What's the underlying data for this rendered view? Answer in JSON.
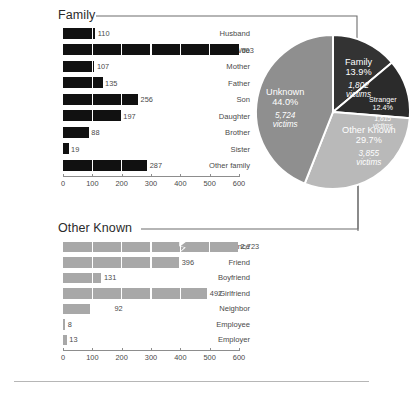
{
  "sections": {
    "family": {
      "title": "Family"
    },
    "other": {
      "title": "Other Known"
    }
  },
  "colors": {
    "family_bar": "#111111",
    "other_bar": "#a8a8a8",
    "pie_family": "#333333",
    "pie_stranger": "#2b2b2b",
    "pie_other_known": "#b9b9b9",
    "pie_unknown": "#8f8f8f",
    "axis": "#8d8d8d",
    "text": "#4a4a4a"
  },
  "chart_data": [
    {
      "type": "bar",
      "id": "family",
      "title": "Family",
      "orientation": "horizontal",
      "categories": [
        "Husband",
        "Wife",
        "Mother",
        "Father",
        "Son",
        "Daughter",
        "Brother",
        "Sister",
        "Other family"
      ],
      "values": [
        110,
        603,
        107,
        135,
        256,
        197,
        88,
        19,
        287
      ],
      "value_labels": [
        "110",
        "603",
        "107",
        "135",
        "256",
        "197",
        "88",
        "19",
        "287"
      ],
      "xlabel": "",
      "ylabel": "",
      "xlim": [
        0,
        600
      ],
      "xticks": [
        0,
        100,
        200,
        300,
        400,
        500,
        600
      ],
      "xtick_labels": [
        "0",
        "100",
        "200",
        "300",
        "400",
        "500",
        "600"
      ],
      "grid": true,
      "legend": false
    },
    {
      "type": "bar",
      "id": "other_known",
      "title": "Other Known",
      "orientation": "horizontal",
      "categories": [
        "Acquaintance",
        "Friend",
        "Boyfriend",
        "Girlfriend",
        "Neighbor",
        "Employee",
        "Employer"
      ],
      "values": [
        2723,
        396,
        131,
        492,
        92,
        8,
        13
      ],
      "value_labels": [
        "2,723",
        "396",
        "131",
        "492",
        "92",
        "8",
        "13"
      ],
      "axis_break": {
        "category": "Acquaintance",
        "note": "bar truncated with zig-zag break"
      },
      "xlabel": "",
      "ylabel": "",
      "xlim": [
        0,
        600
      ],
      "xticks": [
        0,
        100,
        200,
        300,
        400,
        500,
        600
      ],
      "xtick_labels": [
        "0",
        "100",
        "200",
        "300",
        "400",
        "500",
        "600"
      ],
      "grid": true,
      "legend": false
    },
    {
      "type": "pie",
      "id": "relationship_pie",
      "title": "",
      "labels": [
        "Family",
        "Stranger",
        "Other Known",
        "Unknown"
      ],
      "percents": [
        13.9,
        12.4,
        29.7,
        44.0
      ],
      "percent_labels": [
        "13.9%",
        "12.4%",
        "29.7%",
        "44.0%"
      ],
      "counts": [
        1802,
        1615,
        3855,
        5724
      ],
      "count_labels": [
        "1,802",
        "1,615",
        "3,855",
        "5,724"
      ],
      "count_unit": "victims",
      "colors": [
        "#333333",
        "#2b2b2b",
        "#b9b9b9",
        "#8f8f8f"
      ],
      "start_angle_deg": 0,
      "legend": false
    }
  ]
}
